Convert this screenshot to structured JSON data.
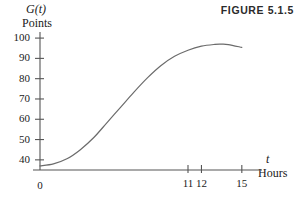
{
  "figure": {
    "caption": "FIGURE 5.1.5"
  },
  "axes": {
    "y_symbol": "G(t)",
    "y_units": "Points",
    "x_symbol": "t",
    "x_units": "Hours",
    "origin_label": "0"
  },
  "chart_data": {
    "type": "line",
    "title": "FIGURE 5.1.5",
    "xlabel": "Hours",
    "ylabel": "Points",
    "x_symbol": "t",
    "y_symbol": "G(t)",
    "grid": false,
    "legend": "none",
    "xlim": [
      0,
      16.5
    ],
    "ylim": [
      35,
      103
    ],
    "xticks": [
      0,
      11,
      12,
      15
    ],
    "xtick_labels": [
      "0",
      "11",
      "12",
      "15"
    ],
    "yticks": [
      40,
      50,
      60,
      70,
      80,
      90,
      100
    ],
    "ytick_labels": [
      "40",
      "50",
      "60",
      "70",
      "80",
      "90",
      "100"
    ],
    "line_color": "#6b6b6b",
    "axis_color": "#555555",
    "series": [
      {
        "name": "G(t)",
        "x": [
          0,
          1,
          2,
          3,
          4,
          5,
          6,
          7,
          8,
          9,
          10,
          11,
          12,
          13,
          13.5,
          14,
          15
        ],
        "y": [
          37,
          38,
          40.5,
          45,
          51,
          58.5,
          66,
          73.5,
          80.5,
          86.5,
          91,
          94,
          96,
          96.9,
          97,
          96.8,
          95.4
        ]
      }
    ],
    "annotations": []
  }
}
